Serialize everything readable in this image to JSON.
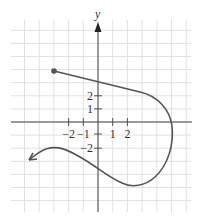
{
  "chart_data": {
    "type": "line",
    "title": "",
    "xlabel": "",
    "ylabel": "y",
    "grid": true,
    "xlim": [
      -6,
      6
    ],
    "ylim": [
      -7,
      7
    ],
    "x_ticks": [
      {
        "value": -2,
        "label": "−2"
      },
      {
        "value": -1,
        "label": "−1"
      },
      {
        "value": 1,
        "label": "1"
      },
      {
        "value": 2,
        "label": "2"
      }
    ],
    "y_ticks": [
      {
        "value": 2,
        "label": "2"
      },
      {
        "value": 1,
        "label": "1"
      },
      {
        "value": -2,
        "label": "−2"
      }
    ],
    "series": [
      {
        "name": "curve",
        "start_marker": "closed-dot",
        "end_marker": "arrow",
        "color": "#555555",
        "points": [
          {
            "x": -3,
            "y": 3.9
          },
          {
            "x": 0,
            "y": 3
          },
          {
            "x": 3,
            "y": 2.1
          },
          {
            "x": 4.8,
            "y": 0
          },
          {
            "x": 4.8,
            "y": -2
          },
          {
            "x": 2,
            "y": -4.8
          },
          {
            "x": 0,
            "y": -3.6
          },
          {
            "x": -3,
            "y": -2
          },
          {
            "x": -4.6,
            "y": -2.9
          }
        ]
      }
    ]
  }
}
